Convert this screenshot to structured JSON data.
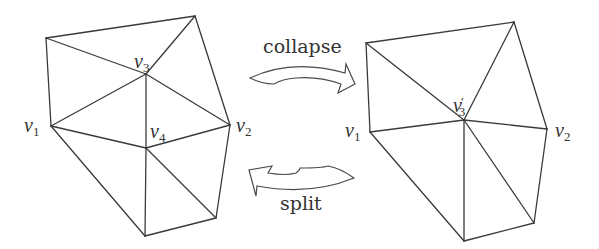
{
  "figure": {
    "stroke_color": "#3a3a3a",
    "background": "#ffffff"
  },
  "operations": {
    "collapse": {
      "label": "collapse",
      "direction": "right"
    },
    "split": {
      "label": "split",
      "direction": "left"
    }
  },
  "left_mesh": {
    "name": "before-collapse",
    "labels": {
      "v1": {
        "base": "v",
        "sub": "1"
      },
      "v2": {
        "base": "v",
        "sub": "2"
      },
      "v3": {
        "base": "v",
        "sub": "3"
      },
      "v4": {
        "base": "v",
        "sub": "4"
      }
    },
    "vertices": {
      "tl": [
        46,
        38
      ],
      "tr": [
        195,
        16
      ],
      "v3": [
        146,
        74
      ],
      "v1": [
        51,
        126
      ],
      "v4": [
        146,
        148
      ],
      "v2": [
        230,
        125
      ],
      "br": [
        216,
        218
      ],
      "b": [
        145,
        236
      ]
    },
    "edges": [
      [
        "tl",
        "tr"
      ],
      [
        "tl",
        "v1"
      ],
      [
        "tl",
        "v3"
      ],
      [
        "tr",
        "v3"
      ],
      [
        "tr",
        "v2"
      ],
      [
        "v3",
        "v1"
      ],
      [
        "v3",
        "v4"
      ],
      [
        "v3",
        "v2"
      ],
      [
        "v1",
        "v4"
      ],
      [
        "v4",
        "v2"
      ],
      [
        "v1",
        "b"
      ],
      [
        "v4",
        "b"
      ],
      [
        "v4",
        "br"
      ],
      [
        "v2",
        "br"
      ],
      [
        "br",
        "b"
      ]
    ]
  },
  "right_mesh": {
    "name": "after-collapse",
    "labels": {
      "v1": {
        "base": "v",
        "sub": "1"
      },
      "v2": {
        "base": "v",
        "sub": "2"
      },
      "v3p": {
        "base": "v",
        "prime": "′",
        "sub": "3"
      }
    },
    "vertices": {
      "tl": [
        366,
        43
      ],
      "tr": [
        514,
        22
      ],
      "v3p": [
        464,
        120
      ],
      "v1": [
        370,
        132
      ],
      "v2": [
        547,
        129
      ],
      "br": [
        534,
        223
      ],
      "b": [
        464,
        241
      ]
    },
    "edges": [
      [
        "tl",
        "tr"
      ],
      [
        "tl",
        "v1"
      ],
      [
        "tl",
        "v3p"
      ],
      [
        "tr",
        "v3p"
      ],
      [
        "tr",
        "v2"
      ],
      [
        "v1",
        "v3p"
      ],
      [
        "v3p",
        "v2"
      ],
      [
        "v1",
        "b"
      ],
      [
        "v3p",
        "b"
      ],
      [
        "v3p",
        "br"
      ],
      [
        "v2",
        "br"
      ],
      [
        "br",
        "b"
      ]
    ]
  }
}
